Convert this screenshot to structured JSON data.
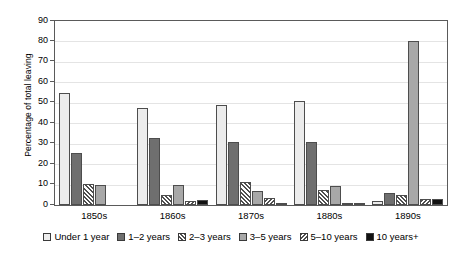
{
  "chart_data": {
    "type": "bar",
    "title": "",
    "subtitle": "",
    "xlabel": "",
    "ylabel": "Percentage of total leaving",
    "ylim": [
      0,
      90
    ],
    "ytick_step": 10,
    "yticks": [
      "90",
      "80",
      "70",
      "60",
      "50",
      "40",
      "30",
      "20",
      "10",
      "0"
    ],
    "grid": true,
    "legend_position": "bottom",
    "categories": [
      "1850s",
      "1860s",
      "1870s",
      "1880s",
      "1890s"
    ],
    "series": [
      {
        "name": "Under 1 year",
        "fill": "light-gray",
        "values": [
          55.0,
          47.5,
          49.0,
          51.0,
          2.0
        ]
      },
      {
        "name": "1–2 years",
        "fill": "dark-gray",
        "values": [
          25.5,
          33.0,
          31.0,
          31.0,
          6.0
        ]
      },
      {
        "name": "2–3 years",
        "fill": "hatch-backslash",
        "values": [
          10.5,
          5.0,
          11.5,
          7.5,
          5.0
        ]
      },
      {
        "name": "3–5 years",
        "fill": "medium-gray",
        "values": [
          10.0,
          10.0,
          7.0,
          9.5,
          80.0
        ]
      },
      {
        "name": "5–10 years",
        "fill": "hatch-forwardslash",
        "values": [
          0.0,
          2.0,
          3.5,
          1.0,
          3.0
        ]
      },
      {
        "name": "10 years+",
        "fill": "black",
        "values": [
          0.0,
          2.5,
          1.0,
          1.0,
          3.0
        ]
      }
    ]
  },
  "legend": {
    "items": [
      {
        "label": "Under 1 year"
      },
      {
        "label": "1–2 years"
      },
      {
        "label": "2–3 years"
      },
      {
        "label": "3–5 years"
      },
      {
        "label": "5–10 years"
      },
      {
        "label": "10 years+"
      }
    ]
  },
  "colors": {
    "series_0": "#ececec",
    "series_1": "#6f6f6f",
    "series_2": "#4f4f4f",
    "series_3": "#a8a8a8",
    "series_4": "#4f4f4f",
    "series_5": "#111111",
    "axis": "#5a5a5a",
    "grid": "#e4e4e4"
  }
}
